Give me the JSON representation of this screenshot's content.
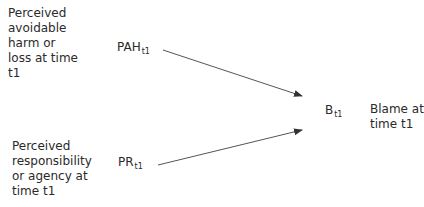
{
  "diagram": {
    "type": "path-diagram",
    "nodes": [
      {
        "id": "PAH",
        "symbol": "PAH",
        "subscript": "t1",
        "description_lines": [
          "Perceived",
          "avoidable",
          "harm or",
          "loss at time",
          "t1"
        ]
      },
      {
        "id": "PR",
        "symbol": "PR",
        "subscript": "t1",
        "description_lines": [
          "Perceived",
          "responsibility",
          "or agency at",
          "time t1"
        ]
      },
      {
        "id": "B",
        "symbol": "B",
        "subscript": "t1",
        "description_lines": [
          "Blame at",
          "time t1"
        ]
      }
    ],
    "edges": [
      {
        "from": "PAH",
        "to": "B"
      },
      {
        "from": "PR",
        "to": "B"
      }
    ],
    "colors": {
      "text": "#2a2a2a",
      "arrow": "#444444"
    }
  }
}
